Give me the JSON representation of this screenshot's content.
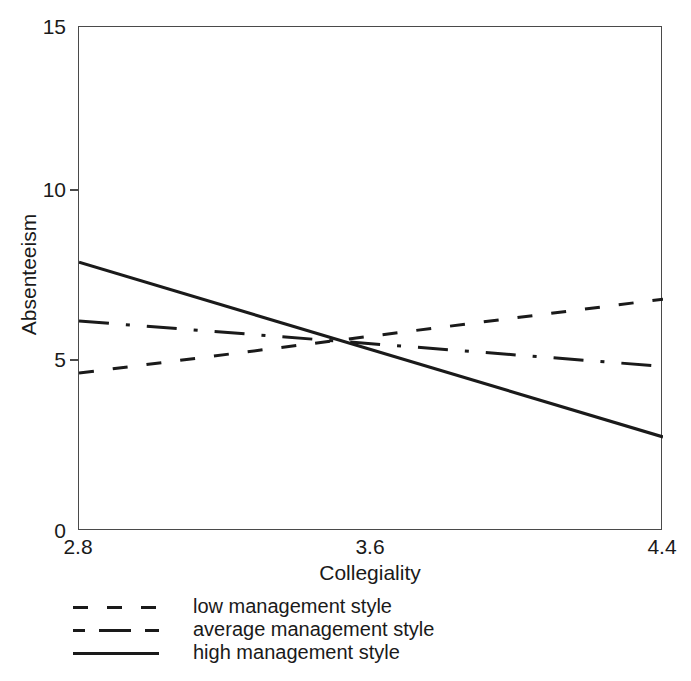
{
  "chart_data": {
    "type": "line",
    "title": "",
    "xlabel": "Collegiality",
    "ylabel": "Absenteeism",
    "xlim": [
      2.8,
      4.4
    ],
    "ylim": [
      0,
      15
    ],
    "xticks": [
      "2.8",
      "3.6",
      "4.4"
    ],
    "xtick_values": [
      2.8,
      3.6,
      4.4
    ],
    "yticks": [
      "0",
      "5",
      "10",
      "15"
    ],
    "ytick_values": [
      0,
      5,
      10,
      15
    ],
    "grid": false,
    "legend_position": "below",
    "x": [
      2.8,
      4.4
    ],
    "series": [
      {
        "name": "low management style",
        "style": "dashed",
        "color": "#1a1a1a",
        "values": [
          4.7,
          6.9
        ]
      },
      {
        "name": "average management style",
        "style": "dash-dot",
        "color": "#1a1a1a",
        "values": [
          6.25,
          4.9
        ]
      },
      {
        "name": "high management style",
        "style": "solid",
        "color": "#1a1a1a",
        "values": [
          8.0,
          2.8
        ]
      }
    ]
  },
  "axes": {
    "y_title": "Absenteeism",
    "x_title": "Collegiality",
    "y_tick_labels": [
      "15",
      "10",
      "5",
      "0"
    ],
    "x_tick_labels": [
      "2.8",
      "3.6",
      "4.4"
    ]
  },
  "legend": {
    "items": [
      {
        "label": "low management style",
        "style": "dashed"
      },
      {
        "label": "average management style",
        "style": "dash-dot"
      },
      {
        "label": "high management style",
        "style": "solid"
      }
    ]
  },
  "colors": {
    "line": "#1a1a1a",
    "frame": "#4a4a4a",
    "background": "#ffffff",
    "text": "#1a1a1a"
  }
}
